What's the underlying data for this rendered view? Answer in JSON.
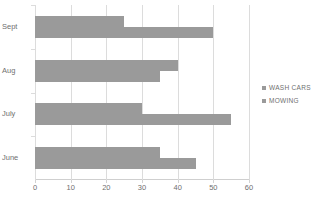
{
  "chart_data": {
    "type": "bar",
    "orientation": "horizontal",
    "title": "",
    "xlabel": "",
    "ylabel": "",
    "categories": [
      "Sept",
      "Aug",
      "July",
      "June"
    ],
    "series": [
      {
        "name": "WASH CARS",
        "values": [
          25,
          40,
          30,
          35
        ],
        "color": "#9a9a9a"
      },
      {
        "name": "MOWING",
        "values": [
          50,
          35,
          55,
          45
        ],
        "color": "#9a9a9a"
      }
    ],
    "xlim": [
      0,
      60
    ],
    "xticks": [
      0,
      10,
      20,
      30,
      40,
      50,
      60
    ],
    "xtick_labels": [
      "0",
      "10",
      "20",
      "30",
      "40",
      "50",
      "60"
    ],
    "grid": "vertical",
    "legend_position": "right"
  },
  "legend": {
    "items": [
      {
        "label": "WASH CARS",
        "marker": "square-marker-icon"
      },
      {
        "label": "MOWING",
        "marker": "square-marker-icon"
      }
    ]
  },
  "axes": {
    "category_labels": [
      "Sept",
      "Aug",
      "July",
      "June"
    ],
    "value_tick_labels": [
      "0",
      "10",
      "20",
      "30",
      "40",
      "50",
      "60"
    ]
  },
  "colors": {
    "bar": "#9a9a9a",
    "gridline": "#dcdcdc",
    "text": "#6f6f6f",
    "background": "#ffffff"
  }
}
